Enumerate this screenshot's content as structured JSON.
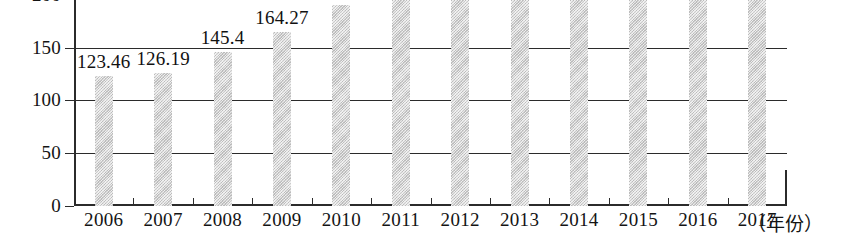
{
  "chart_data": {
    "type": "bar",
    "title": "",
    "xlabel": "（年份）",
    "ylabel": "",
    "categories": [
      "2006",
      "2007",
      "2008",
      "2009",
      "2010",
      "2011",
      "2012",
      "2013",
      "2014",
      "2015",
      "2016",
      "2017"
    ],
    "values": [
      123.46,
      126.19,
      145.4,
      164.27,
      190,
      212,
      212,
      212,
      212,
      212,
      212,
      212
    ],
    "labeled_values": [
      "123.46",
      "126.19",
      "145.4",
      "164.27",
      "",
      "",
      "",
      "",
      "",
      "",
      "",
      ""
    ],
    "ylim": [
      0,
      212
    ],
    "yticks": [
      0,
      50,
      100,
      150,
      200
    ],
    "ytick_labels": [
      "0",
      "50",
      "100",
      "150",
      "200"
    ],
    "grid": true,
    "legend": null,
    "bar_color": "#d3d3d3",
    "axis_color": "#2b2b2b",
    "note_clipped_top": "Bars for 2011-2017 and the 200 tick label are cut off by the top crop edge"
  },
  "axis": {
    "x_title": "（年份）"
  }
}
